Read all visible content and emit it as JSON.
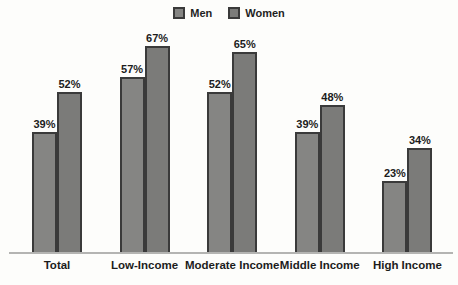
{
  "chart_data": {
    "type": "bar",
    "title": "",
    "categories": [
      "Total",
      "Low-Income",
      "Moderate Income",
      "Middle Income",
      "High Income"
    ],
    "series": [
      {
        "name": "Men",
        "color": "#858583",
        "values": [
          39,
          57,
          52,
          39,
          23
        ]
      },
      {
        "name": "Women",
        "color": "#7b7b79",
        "values": [
          52,
          67,
          65,
          48,
          34
        ]
      }
    ],
    "value_suffix": "%",
    "data_labels": true,
    "ylim": [
      0,
      72
    ],
    "grid": false,
    "legend_position": "top-center",
    "axis_line_color": "#b4b4b2",
    "bar_border_color": "#3a3a3a",
    "label_color": "#1c1c1c",
    "background": "#fdfdfb"
  }
}
